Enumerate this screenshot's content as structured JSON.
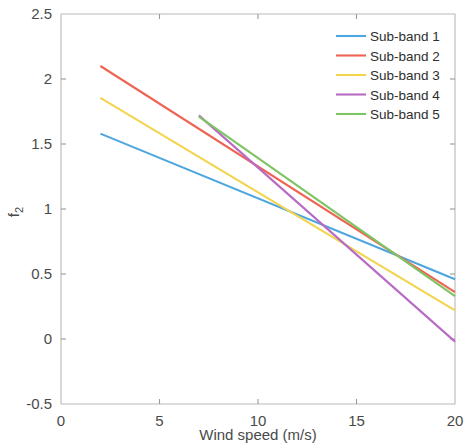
{
  "chart_data": {
    "type": "line",
    "title": "",
    "xlabel": "Wind speed (m/s)",
    "ylabel": "f_2",
    "ylabel_display": "f",
    "ylabel_sub": "2",
    "xlim": [
      0,
      20
    ],
    "ylim": [
      -0.5,
      2.5
    ],
    "xticks": [
      0,
      5,
      10,
      15,
      20
    ],
    "xtick_labels": [
      "0",
      "5",
      "10",
      "15",
      "20"
    ],
    "yticks": [
      -0.5,
      0,
      0.5,
      1,
      1.5,
      2,
      2.5
    ],
    "ytick_labels": [
      "-0.5",
      "0",
      "0.5",
      "1",
      "1.5",
      "2",
      "2.5"
    ],
    "grid": false,
    "legend_position": "upper right",
    "legend_frame": false,
    "series": [
      {
        "name": "Sub-band 1",
        "color": "#4DA6E0",
        "x": [
          2,
          20
        ],
        "values": [
          1.58,
          0.46
        ]
      },
      {
        "name": "Sub-band 2",
        "color": "#EE6352",
        "x": [
          2,
          20
        ],
        "values": [
          2.1,
          0.36
        ]
      },
      {
        "name": "Sub-band 3",
        "color": "#F2D44E",
        "x": [
          2,
          20
        ],
        "values": [
          1.855,
          0.22
        ]
      },
      {
        "name": "Sub-band 4",
        "color": "#B86BC4",
        "x": [
          7,
          20
        ],
        "values": [
          1.72,
          -0.02
        ]
      },
      {
        "name": "Sub-band 5",
        "color": "#7DC462",
        "x": [
          7,
          20
        ],
        "values": [
          1.71,
          0.33
        ]
      }
    ]
  },
  "legend": {
    "items": [
      {
        "label": "Sub-band 1"
      },
      {
        "label": "Sub-band 2"
      },
      {
        "label": "Sub-band 3"
      },
      {
        "label": "Sub-band 4"
      },
      {
        "label": "Sub-band 5"
      }
    ]
  }
}
